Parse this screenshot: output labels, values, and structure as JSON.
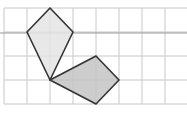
{
  "diagram": {
    "type": "grid-geometry",
    "grid": {
      "columns_x": [
        4,
        27,
        50,
        73,
        96,
        119,
        142,
        165
      ],
      "rows_y": [
        8,
        32,
        56,
        80,
        104
      ],
      "right_edge": 187,
      "line_color": "#c8c8c8"
    },
    "reference_line": {
      "y": 33,
      "x1": 0,
      "x2": 187,
      "color": "#9a9a9a"
    },
    "shapes": [
      {
        "name": "kite",
        "points": "50,8 73,32 50,80 27,32",
        "fill": "#e4e4e4",
        "stroke": "#333333"
      },
      {
        "name": "quadrilateral",
        "points": "50,80 96,56 119,80 96,104",
        "fill": "#c4c4c4",
        "stroke": "#333333"
      }
    ]
  }
}
